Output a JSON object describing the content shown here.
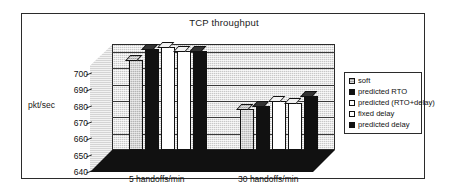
{
  "figure": {
    "title": "TCP throughput",
    "ylabel": "pkt/sec"
  },
  "chart_data": {
    "type": "bar",
    "title": "TCP throughput",
    "xlabel": "",
    "ylabel": "pkt/sec",
    "ylim": [
      640,
      705
    ],
    "yticks": [
      640,
      650,
      660,
      670,
      680,
      690,
      700
    ],
    "grid": true,
    "legend_position": "right",
    "three_d": true,
    "categories": [
      "5 handoffs/min",
      "30 handoffs/min"
    ],
    "series": [
      {
        "name": "soft",
        "marker": "hatched",
        "values": [
          695,
          665
        ]
      },
      {
        "name": "predicted RTO",
        "marker": "black",
        "values": [
          702,
          667
        ]
      },
      {
        "name": "predicted (RTO+delay)",
        "marker": "white",
        "values": [
          703,
          670
        ]
      },
      {
        "name": "fixed delay",
        "marker": "white",
        "values": [
          701,
          669
        ]
      },
      {
        "name": "predicted delay",
        "marker": "black",
        "values": [
          701,
          673
        ]
      }
    ]
  },
  "ytick_labels": [
    "700",
    "690",
    "680",
    "670",
    "660",
    "650",
    "640"
  ],
  "legend": {
    "items": [
      {
        "label": "soft",
        "swatch": "hatched-swatch"
      },
      {
        "label": "predicted RTO",
        "swatch": "black-swatch"
      },
      {
        "label": "predicted (RTO+delay)",
        "swatch": "white-swatch"
      },
      {
        "label": "fixed delay",
        "swatch": "white-swatch"
      },
      {
        "label": "predicted delay",
        "swatch": "black-swatch"
      }
    ]
  },
  "colors": {
    "frame": "#2b2b2b",
    "wall": "#c8c8c8",
    "black_bar": "#111111",
    "white_bar": "#ffffff",
    "hatched_bar": "#b5b5b5",
    "background": "#ffffff"
  }
}
